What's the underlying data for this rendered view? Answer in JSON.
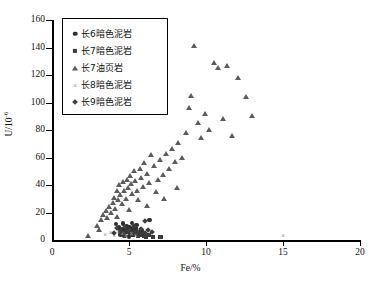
{
  "chart_data": {
    "type": "scatter",
    "title": "",
    "xlabel": "Fe/%",
    "ylabel": "U/10-6",
    "ylabel_base": "U/10",
    "ylabel_exp": "-6",
    "xlim": [
      0,
      20
    ],
    "ylim": [
      0,
      160
    ],
    "xticks": [
      0,
      5,
      10,
      15,
      20
    ],
    "yticks": [
      0,
      20,
      40,
      60,
      80,
      100,
      120,
      140,
      160
    ],
    "grid": false,
    "legend_position": "top-left-inside",
    "series": [
      {
        "name": "长6暗色泥岩",
        "marker": "circle",
        "color": "#2e2e2e",
        "points": [
          [
            4.15,
            11.5
          ],
          [
            4.35,
            9.2
          ],
          [
            4.55,
            8.0
          ],
          [
            4.62,
            12.0
          ],
          [
            4.78,
            7.0
          ],
          [
            4.85,
            10.0
          ],
          [
            4.95,
            6.2
          ],
          [
            5.05,
            9.0
          ],
          [
            5.12,
            5.2
          ],
          [
            5.22,
            7.8
          ],
          [
            5.3,
            4.5
          ],
          [
            5.38,
            6.5
          ],
          [
            5.45,
            8.5
          ],
          [
            5.55,
            5.0
          ],
          [
            5.62,
            3.8
          ],
          [
            5.72,
            6.0
          ],
          [
            5.85,
            4.2
          ],
          [
            6.0,
            3.2
          ],
          [
            6.35,
            14.5
          ],
          [
            4.45,
            4.0
          ],
          [
            4.7,
            3.0
          ],
          [
            5.0,
            2.6
          ],
          [
            5.2,
            12.5
          ],
          [
            5.5,
            11.0
          ]
        ]
      },
      {
        "name": "长7暗色泥岩",
        "marker": "square",
        "color": "#3a3a3a",
        "points": [
          [
            4.9,
            6.0
          ],
          [
            5.1,
            4.8
          ],
          [
            5.25,
            3.6
          ],
          [
            5.4,
            5.5
          ],
          [
            5.6,
            2.8
          ],
          [
            5.78,
            4.0
          ],
          [
            5.95,
            3.0
          ],
          [
            6.1,
            2.2
          ],
          [
            6.3,
            3.4
          ],
          [
            6.55,
            2.0
          ],
          [
            7.05,
            2.4
          ],
          [
            4.6,
            5.2
          ],
          [
            4.4,
            6.8
          ],
          [
            5.85,
            6.2
          ]
        ]
      },
      {
        "name": "长7油页岩",
        "marker": "triangle",
        "color": "#5c5c5c",
        "points": [
          [
            2.35,
            3.0
          ],
          [
            2.9,
            10.5
          ],
          [
            3.2,
            14.5
          ],
          [
            3.35,
            18.0
          ],
          [
            3.5,
            21.5
          ],
          [
            3.6,
            16.0
          ],
          [
            3.72,
            24.0
          ],
          [
            3.85,
            20.0
          ],
          [
            3.95,
            27.0
          ],
          [
            4.05,
            31.0
          ],
          [
            4.12,
            23.0
          ],
          [
            4.2,
            36.0
          ],
          [
            4.3,
            29.0
          ],
          [
            4.38,
            40.5
          ],
          [
            4.45,
            33.0
          ],
          [
            4.52,
            26.0
          ],
          [
            4.6,
            42.0
          ],
          [
            4.7,
            35.5
          ],
          [
            4.78,
            30.0
          ],
          [
            4.85,
            44.0
          ],
          [
            4.95,
            38.0
          ],
          [
            5.05,
            47.0
          ],
          [
            5.12,
            41.0
          ],
          [
            5.2,
            33.5
          ],
          [
            5.3,
            50.0
          ],
          [
            5.4,
            43.0
          ],
          [
            5.5,
            36.0
          ],
          [
            5.6,
            29.0
          ],
          [
            5.7,
            52.0
          ],
          [
            5.8,
            45.0
          ],
          [
            5.9,
            39.0
          ],
          [
            6.0,
            56.0
          ],
          [
            6.15,
            48.0
          ],
          [
            6.3,
            41.5
          ],
          [
            6.45,
            62.0
          ],
          [
            6.6,
            54.0
          ],
          [
            6.75,
            35.0
          ],
          [
            6.9,
            44.0
          ],
          [
            7.05,
            58.0
          ],
          [
            7.2,
            47.5
          ],
          [
            7.4,
            63.0
          ],
          [
            7.6,
            52.0
          ],
          [
            7.8,
            66.0
          ],
          [
            8.0,
            57.0
          ],
          [
            8.2,
            71.0
          ],
          [
            8.45,
            60.0
          ],
          [
            8.7,
            78.0
          ],
          [
            8.9,
            96.0
          ],
          [
            9.05,
            105.0
          ],
          [
            9.25,
            141.0
          ],
          [
            9.5,
            85.0
          ],
          [
            9.7,
            74.0
          ],
          [
            9.95,
            92.0
          ],
          [
            10.2,
            80.0
          ],
          [
            10.5,
            129.0
          ],
          [
            10.8,
            125.0
          ],
          [
            11.1,
            88.0
          ],
          [
            11.4,
            127.0
          ],
          [
            11.7,
            76.0
          ],
          [
            12.1,
            118.0
          ],
          [
            12.6,
            104.0
          ],
          [
            13.0,
            90.0
          ],
          [
            8.1,
            38.0
          ],
          [
            7.3,
            30.0
          ],
          [
            6.2,
            25.0
          ],
          [
            5.0,
            22.0
          ],
          [
            4.25,
            17.0
          ],
          [
            3.05,
            7.5
          ]
        ]
      },
      {
        "name": "长8暗色泥岩",
        "marker": "cross",
        "color": "#9a9a9a",
        "points": [
          [
            3.45,
            4.0
          ],
          [
            3.8,
            5.5
          ],
          [
            4.05,
            3.2
          ],
          [
            4.3,
            6.0
          ],
          [
            4.55,
            4.5
          ],
          [
            4.8,
            3.0
          ],
          [
            5.15,
            5.0
          ],
          [
            5.45,
            3.6
          ],
          [
            15.0,
            3.5
          ]
        ]
      },
      {
        "name": "长9暗色泥岩",
        "marker": "diamond",
        "color": "#3d3d3d",
        "points": [
          [
            4.25,
            8.5
          ],
          [
            4.5,
            6.5
          ],
          [
            4.75,
            9.5
          ],
          [
            5.0,
            7.2
          ],
          [
            5.3,
            10.0
          ],
          [
            5.55,
            6.0
          ],
          [
            5.75,
            8.0
          ],
          [
            6.05,
            5.0
          ],
          [
            6.25,
            7.0
          ],
          [
            6.5,
            5.8
          ],
          [
            6.05,
            14.0
          ],
          [
            4.0,
            5.0
          ]
        ]
      }
    ]
  },
  "legend": {
    "items": [
      {
        "label": "长6暗色泥岩",
        "marker": "circle"
      },
      {
        "label": "长7暗色泥岩",
        "marker": "square"
      },
      {
        "label": "长7油页岩",
        "marker": "triangle"
      },
      {
        "label": "长8暗色泥岩",
        "marker": "cross"
      },
      {
        "label": "长9暗色泥岩",
        "marker": "diamond"
      }
    ]
  },
  "axis": {
    "x_title": "Fe/%",
    "y_title_base": "U/10",
    "y_title_exp": "-6",
    "x_ticks": [
      "0",
      "5",
      "10",
      "15",
      "20"
    ],
    "y_ticks": [
      "0",
      "20",
      "40",
      "60",
      "80",
      "100",
      "120",
      "140",
      "160"
    ]
  },
  "cross_glyph": "×"
}
